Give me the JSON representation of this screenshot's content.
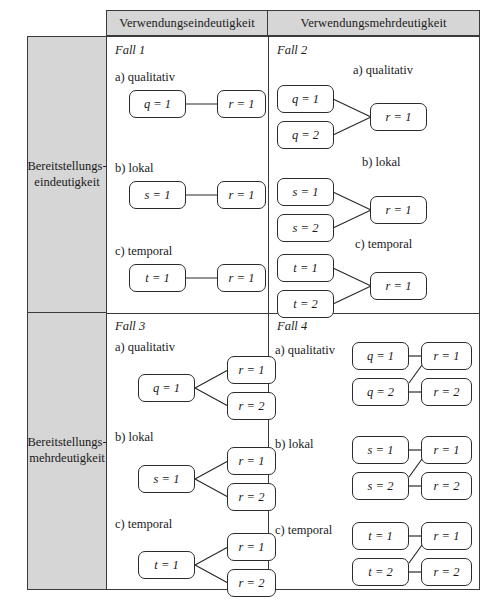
{
  "figure": {
    "column_headers": [
      "Verwendungseindeutigkeit",
      "Verwendungsmehrdeutigkeit"
    ],
    "row_headers": [
      "Bereitstellungs-\neindeutigkeit",
      "Bereitstellungs-\nmehrdeutigkeit"
    ],
    "row_headers_lines": [
      [
        "Bereitstellungs-",
        "eindeutigkeit"
      ],
      [
        "Bereitstellungs-",
        "mehrdeutigkeit"
      ]
    ],
    "colors": {
      "header_fill": "#d6d6d6",
      "border": "#3a3a3a",
      "node_border": "#2b2b2b",
      "node_fill": "#ffffff",
      "text": "#1a1a1a"
    }
  },
  "quadrants": [
    {
      "id": "fall-1",
      "title": "Fall 1",
      "sections": [
        {
          "label": "a) qualitativ",
          "left_nodes": [
            "q = 1"
          ],
          "right_nodes": [
            "r = 1"
          ]
        },
        {
          "label": "b) lokal",
          "left_nodes": [
            "s = 1"
          ],
          "right_nodes": [
            "r = 1"
          ]
        },
        {
          "label": "c) temporal",
          "left_nodes": [
            "t = 1"
          ],
          "right_nodes": [
            "r = 1"
          ]
        }
      ]
    },
    {
      "id": "fall-2",
      "title": "Fall 2",
      "sections": [
        {
          "label": "a) qualitativ",
          "left_nodes": [
            "q = 1",
            "q = 2"
          ],
          "right_nodes": [
            "r = 1"
          ]
        },
        {
          "label": "b) lokal",
          "left_nodes": [
            "s = 1",
            "s = 2"
          ],
          "right_nodes": [
            "r = 1"
          ]
        },
        {
          "label": "c) temporal",
          "left_nodes": [
            "t = 1",
            "t = 2"
          ],
          "right_nodes": [
            "r = 1"
          ]
        }
      ]
    },
    {
      "id": "fall-3",
      "title": "Fall 3",
      "sections": [
        {
          "label": "a) qualitativ",
          "left_nodes": [
            "q = 1"
          ],
          "right_nodes": [
            "r = 1",
            "r = 2"
          ]
        },
        {
          "label": "b) lokal",
          "left_nodes": [
            "s = 1"
          ],
          "right_nodes": [
            "r = 1",
            "r = 2"
          ]
        },
        {
          "label": "c) temporal",
          "left_nodes": [
            "t = 1"
          ],
          "right_nodes": [
            "r = 1",
            "r = 2"
          ]
        }
      ]
    },
    {
      "id": "fall-4",
      "title": "Fall 4",
      "sections": [
        {
          "label": "a) qualitativ",
          "left_nodes": [
            "q = 1",
            "q = 2"
          ],
          "right_nodes": [
            "r = 1",
            "r = 2"
          ]
        },
        {
          "label": "b) lokal",
          "left_nodes": [
            "s = 1",
            "s = 2"
          ],
          "right_nodes": [
            "r = 1",
            "r = 2"
          ]
        },
        {
          "label": "c) temporal",
          "left_nodes": [
            "t = 1",
            "t = 2"
          ],
          "right_nodes": [
            "r = 1",
            "r = 2"
          ]
        }
      ]
    }
  ]
}
